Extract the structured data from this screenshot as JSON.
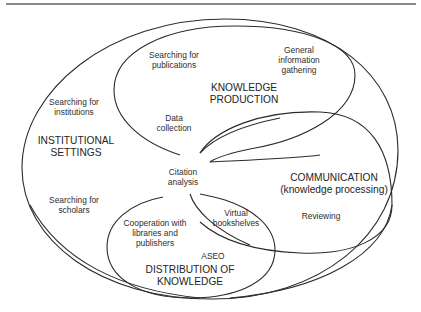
{
  "diagram": {
    "type": "venn-like nested ellipses",
    "regions": [
      {
        "id": "institutional-settings",
        "title": [
          "INSTITUTIONAL",
          "SETTINGS"
        ],
        "items": [
          [
            "Searching for",
            "institutions"
          ],
          [
            "Searching for",
            "scholars"
          ]
        ]
      },
      {
        "id": "knowledge-production",
        "title": [
          "KNOWLEDGE",
          "PRODUCTION"
        ],
        "items": [
          [
            "Searching for",
            "publications"
          ],
          [
            "General",
            "information",
            "gathering"
          ],
          [
            "Data",
            "collection"
          ]
        ]
      },
      {
        "id": "communication",
        "title": [
          "COMMUNICATION",
          "(knowledge processing)"
        ],
        "items": [
          [
            "Reviewing"
          ]
        ]
      },
      {
        "id": "distribution-of-knowledge",
        "title": [
          "DISTRIBUTION OF",
          "KNOWLEDGE"
        ],
        "items": [
          [
            "Cooperation with",
            "libraries and",
            "publishers"
          ],
          [
            "ASEO"
          ]
        ]
      }
    ],
    "shared_items": {
      "citation_analysis": [
        "Citation",
        "analysis"
      ],
      "virtual_bookshelves": [
        "Virtual",
        "bookshelves"
      ]
    }
  },
  "colors": {
    "stroke": "#2b2b2b",
    "text": "#2e2e2e",
    "rule": "#8a8a8a",
    "background": "#ffffff"
  }
}
